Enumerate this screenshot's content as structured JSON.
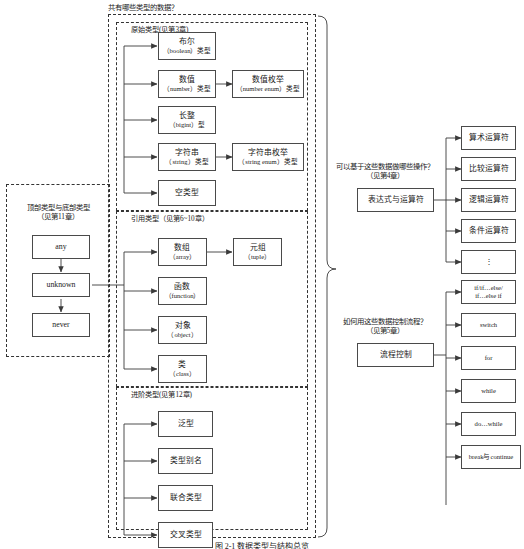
{
  "figure": {
    "caption": "图 2-1  数据类型与结构总览"
  },
  "questions": {
    "types": "共有哪些类型的数据？",
    "operations_line1": "可以基于这些数据做哪些操作？",
    "operations_line2": "（见第4章）",
    "control_flow_line1": "如何用这些数据控制流程？",
    "control_flow_line2": "（见第5章）"
  },
  "groups": {
    "primitive": {
      "label": "原始类型(见第3章)"
    },
    "reference": {
      "label": "引用类型（见第6~10章）"
    },
    "advanced": {
      "label": "进阶类型(见第12章)"
    },
    "topbottom": {
      "label_line1": "顶部类型与底部类型",
      "label_line2": "（见第11章）"
    }
  },
  "primitive_nodes": [
    {
      "cn": "布尔",
      "en": "（boolean）类型"
    },
    {
      "cn": "数值",
      "en": "（number）类型"
    },
    {
      "cn": "长整",
      "en": "（bigint）型"
    },
    {
      "cn": "字符串",
      "en": "（string）类型"
    },
    {
      "cn": "空类型",
      "en": ""
    }
  ],
  "primitive_derived": [
    {
      "cn": "数值枚举",
      "en": "（number enum）类型"
    },
    {
      "cn": "字符串枚举",
      "en": "（string enum）类型"
    }
  ],
  "reference_nodes": [
    {
      "cn": "数组",
      "en": "（array）"
    },
    {
      "cn": "函数",
      "en": "（function）"
    },
    {
      "cn": "对象",
      "en": "（object）"
    },
    {
      "cn": "类",
      "en": "（class）"
    }
  ],
  "reference_derived": [
    {
      "cn": "元组",
      "en": "（tuple）"
    }
  ],
  "advanced_nodes": [
    {
      "cn": "泛型",
      "en": ""
    },
    {
      "cn": "类型别名",
      "en": ""
    },
    {
      "cn": "联合类型",
      "en": ""
    },
    {
      "cn": "交叉类型",
      "en": ""
    }
  ],
  "topbottom_nodes": [
    {
      "cn": "any",
      "en": ""
    },
    {
      "cn": "unknown",
      "en": ""
    },
    {
      "cn": "never",
      "en": ""
    }
  ],
  "operators": {
    "root": {
      "cn": "表达式与运算符",
      "en": ""
    },
    "items": [
      {
        "cn": "算术运算符",
        "en": ""
      },
      {
        "cn": "比较运算符",
        "en": ""
      },
      {
        "cn": "逻辑运算符",
        "en": ""
      },
      {
        "cn": "条件运算符",
        "en": ""
      },
      {
        "cn": "⋮",
        "en": ""
      }
    ]
  },
  "control_flow": {
    "root": {
      "cn": "流程控制",
      "en": ""
    },
    "items": [
      {
        "cn": "if/if…else/",
        "cn2": "if…else if",
        "en": ""
      },
      {
        "cn": "switch",
        "en": ""
      },
      {
        "cn": "for",
        "en": ""
      },
      {
        "cn": "while",
        "en": ""
      },
      {
        "cn": "do…while",
        "en": ""
      },
      {
        "cn": "break与continue",
        "en": ""
      }
    ]
  }
}
